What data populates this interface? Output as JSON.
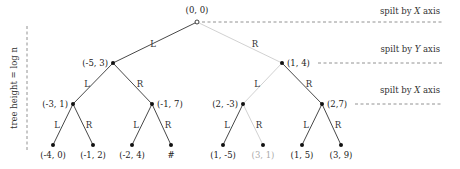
{
  "colors": {
    "edge": "#333333",
    "edge_muted": "#cccccc",
    "node": "#111111",
    "label": "#222222",
    "label_muted": "#aaaaaa",
    "dash": "#777777"
  },
  "height_label": {
    "text": "tree height = log n"
  },
  "levels": [
    {
      "split_prefix": "spilt by ",
      "axis": "X",
      "suffix": " axis",
      "y": 22,
      "dash_x1": 202,
      "dash_x2": 443,
      "label_y": 14
    },
    {
      "split_prefix": "spilt by ",
      "axis": "Y",
      "suffix": " axis",
      "y": 63,
      "dash_x1": 318,
      "dash_x2": 443,
      "label_y": 52
    },
    {
      "split_prefix": "spilt by ",
      "axis": "X",
      "suffix": " axis",
      "y": 104,
      "dash_x1": 355,
      "dash_x2": 443,
      "label_y": 93
    }
  ],
  "nodes": [
    {
      "id": "n0",
      "label": "(0, 0)",
      "x": 197,
      "y": 22,
      "hollow": true,
      "muted": false,
      "lx": 197,
      "ly": 13,
      "anchor": "middle"
    },
    {
      "id": "n1",
      "label": "(-5, 3)",
      "x": 113,
      "y": 63,
      "muted": false,
      "lx": 108,
      "ly": 66,
      "anchor": "end"
    },
    {
      "id": "n2",
      "label": "(1, 4)",
      "x": 282,
      "y": 63,
      "muted": false,
      "lx": 287,
      "ly": 66,
      "anchor": "start"
    },
    {
      "id": "n3",
      "label": "(-3, 1)",
      "x": 73,
      "y": 104,
      "muted": false,
      "lx": 68,
      "ly": 107,
      "anchor": "end"
    },
    {
      "id": "n4",
      "label": "(-1, 7)",
      "x": 152,
      "y": 104,
      "muted": false,
      "lx": 157,
      "ly": 107,
      "anchor": "start"
    },
    {
      "id": "n5",
      "label": "(2, -3)",
      "x": 243,
      "y": 104,
      "muted": false,
      "lx": 238,
      "ly": 107,
      "anchor": "end"
    },
    {
      "id": "n6",
      "label": "(2,7)",
      "x": 322,
      "y": 104,
      "muted": false,
      "lx": 327,
      "ly": 107,
      "anchor": "start"
    },
    {
      "id": "n7",
      "label": "(-4, 0)",
      "x": 53,
      "y": 145,
      "muted": false,
      "lx": 53,
      "ly": 158,
      "anchor": "middle"
    },
    {
      "id": "n8",
      "label": "(-1, 2)",
      "x": 93,
      "y": 145,
      "muted": false,
      "lx": 93,
      "ly": 158,
      "anchor": "middle"
    },
    {
      "id": "n9",
      "label": "(-2, 4)",
      "x": 132,
      "y": 145,
      "muted": false,
      "lx": 132,
      "ly": 158,
      "anchor": "middle"
    },
    {
      "id": "n10",
      "label": "#",
      "x": 171,
      "y": 145,
      "muted": false,
      "lx": 171,
      "ly": 158,
      "anchor": "middle"
    },
    {
      "id": "n11",
      "label": "(1, -5)",
      "x": 223,
      "y": 145,
      "muted": false,
      "lx": 223,
      "ly": 158,
      "anchor": "middle"
    },
    {
      "id": "n12",
      "label": "(3, 1)",
      "x": 263,
      "y": 145,
      "muted": true,
      "lx": 263,
      "ly": 158,
      "anchor": "middle"
    },
    {
      "id": "n13",
      "label": "(1, 5)",
      "x": 302,
      "y": 145,
      "muted": false,
      "lx": 302,
      "ly": 158,
      "anchor": "middle"
    },
    {
      "id": "n14",
      "label": "(3, 9)",
      "x": 341,
      "y": 145,
      "muted": false,
      "lx": 341,
      "ly": 158,
      "anchor": "middle"
    }
  ],
  "edges": [
    {
      "from": "n0",
      "to": "n1",
      "label": "L",
      "muted": false,
      "lx": 153,
      "ly": 47
    },
    {
      "from": "n0",
      "to": "n2",
      "label": "R",
      "muted": true,
      "lx": 255,
      "ly": 47
    },
    {
      "from": "n1",
      "to": "n3",
      "label": "L",
      "muted": false,
      "lx": 87,
      "ly": 87
    },
    {
      "from": "n1",
      "to": "n4",
      "label": "R",
      "muted": false,
      "lx": 140,
      "ly": 87
    },
    {
      "from": "n2",
      "to": "n5",
      "label": "L",
      "muted": true,
      "lx": 257,
      "ly": 87
    },
    {
      "from": "n2",
      "to": "n6",
      "label": "R",
      "muted": false,
      "lx": 309,
      "ly": 87
    },
    {
      "from": "n3",
      "to": "n7",
      "label": "L",
      "muted": false,
      "lx": 57,
      "ly": 128
    },
    {
      "from": "n3",
      "to": "n8",
      "label": "R",
      "muted": false,
      "lx": 89,
      "ly": 128
    },
    {
      "from": "n4",
      "to": "n9",
      "label": "L",
      "muted": false,
      "lx": 136,
      "ly": 128
    },
    {
      "from": "n4",
      "to": "n10",
      "label": "R",
      "muted": false,
      "lx": 168,
      "ly": 128
    },
    {
      "from": "n5",
      "to": "n11",
      "label": "L",
      "muted": false,
      "lx": 227,
      "ly": 128
    },
    {
      "from": "n5",
      "to": "n12",
      "label": "R",
      "muted": true,
      "lx": 259,
      "ly": 128
    },
    {
      "from": "n6",
      "to": "n13",
      "label": "L",
      "muted": false,
      "lx": 306,
      "ly": 128
    },
    {
      "from": "n6",
      "to": "n14",
      "label": "R",
      "muted": false,
      "lx": 338,
      "ly": 128
    }
  ]
}
